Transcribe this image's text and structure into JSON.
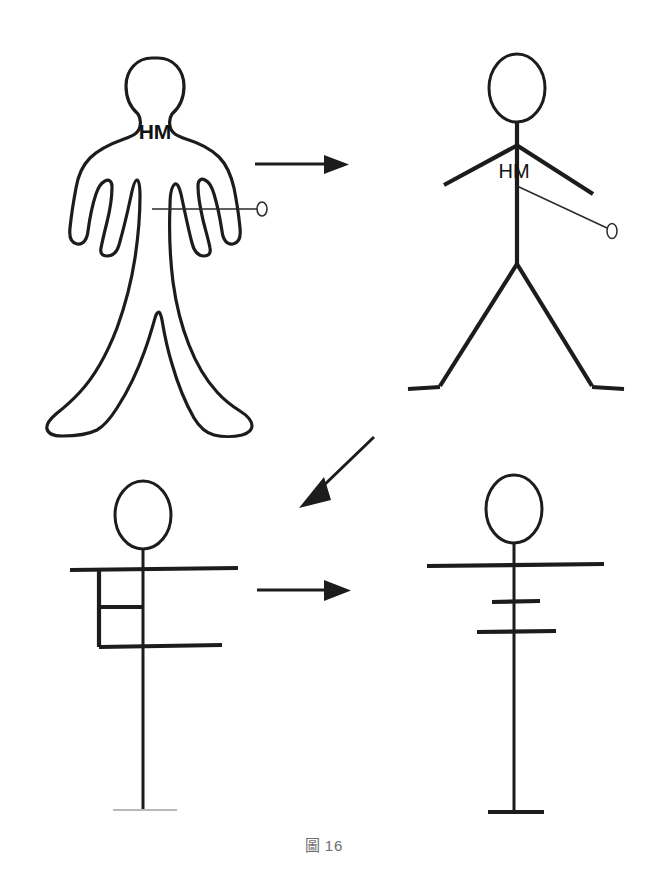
{
  "figure": {
    "caption_label": "圖",
    "caption_number": "16",
    "caption_full": "圖 16",
    "background_color": "#ffffff",
    "ink_color": "#1c1c1c",
    "faint_ink_color": "#b9b9b9"
  },
  "panels": [
    {
      "id": "panel-1",
      "position": "top-left",
      "name": "human-silhouette-outline",
      "description": "Outline drawing of a standing human body viewed from the front, arms at the sides, legs apart",
      "body_label": "HM",
      "pointer": {
        "name": "horizontal-pointer-line",
        "orientation": "horizontal",
        "terminal_marker": "small-ellipse"
      }
    },
    {
      "id": "panel-2",
      "position": "top-right",
      "name": "stick-figure-with-sloping-arms",
      "description": "Stick figure with oval head, vertical spine, downward-sloping arms and splayed legs with flat feet",
      "body_label": "HM",
      "pointer": {
        "name": "diagonal-pointer-line",
        "orientation": "diagonal-down-right",
        "terminal_marker": "small-ellipse"
      }
    },
    {
      "id": "panel-3",
      "position": "bottom-left",
      "name": "stick-figure-with-rectangular-torso",
      "description": "Stick figure with oval head, long horizontal shoulder bar, rectangular torso box divided by a crossbar, lower horizontal bar and long vertical leg with faint ground line",
      "body_label": "",
      "pointer": null
    },
    {
      "id": "panel-4",
      "position": "bottom-right",
      "name": "stick-figure-simplified-crossbars",
      "description": "Final abstraction: oval head, long horizontal shoulder bar, two short crossbars on the spine, and a base bar at the bottom",
      "body_label": "",
      "pointer": null
    }
  ],
  "arrows": [
    {
      "id": "arrow-1",
      "name": "arrow-panel1-to-panel2",
      "direction": "right",
      "from_panel": "panel-1",
      "to_panel": "panel-2"
    },
    {
      "id": "arrow-2",
      "name": "arrow-panel2-to-panel3",
      "direction": "down-left",
      "from_panel": "panel-2",
      "to_panel": "panel-3"
    },
    {
      "id": "arrow-3",
      "name": "arrow-panel3-to-panel4",
      "direction": "right",
      "from_panel": "panel-3",
      "to_panel": "panel-4"
    }
  ]
}
